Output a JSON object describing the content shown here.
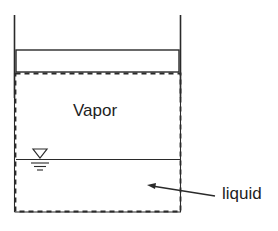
{
  "diagram": {
    "labels": {
      "vapor": "Vapor",
      "liquid": "liquid"
    },
    "colors": {
      "line": "#2a2a2a",
      "text": "#1e1e1e",
      "background": "#ffffff"
    },
    "symbols": {
      "free_surface": "water-level-triangle"
    }
  }
}
